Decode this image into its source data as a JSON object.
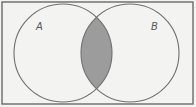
{
  "diagram": {
    "type": "venn",
    "universe": {
      "x": 2,
      "y": 2,
      "width": 191,
      "height": 102,
      "stroke": "#6a6a6a",
      "fill": "#f3f3f1"
    },
    "sets": [
      {
        "label": "A",
        "cx": 63,
        "cy": 53,
        "r": 49,
        "label_x": 36,
        "label_y": 30
      },
      {
        "label": "B",
        "cx": 130,
        "cy": 53,
        "r": 49,
        "label_x": 151,
        "label_y": 30
      }
    ],
    "shaded_region": "A ∩ B",
    "colors": {
      "circle_stroke": "#6f6f6f",
      "intersection_fill": "#9c9c9c",
      "background": "#f3f3f1"
    }
  }
}
